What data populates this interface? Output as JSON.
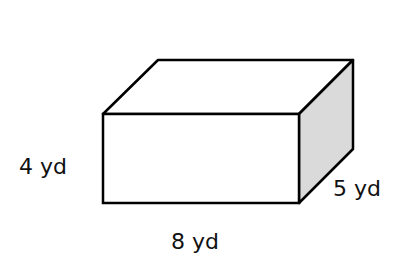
{
  "figure": {
    "type": "rectangular-prism",
    "labels": {
      "height": "4 yd",
      "length": "8 yd",
      "width": "5 yd"
    },
    "colors": {
      "edge": "#000000",
      "front_face": "#ffffff",
      "top_face": "#ffffff",
      "side_face": "#dadada"
    }
  }
}
